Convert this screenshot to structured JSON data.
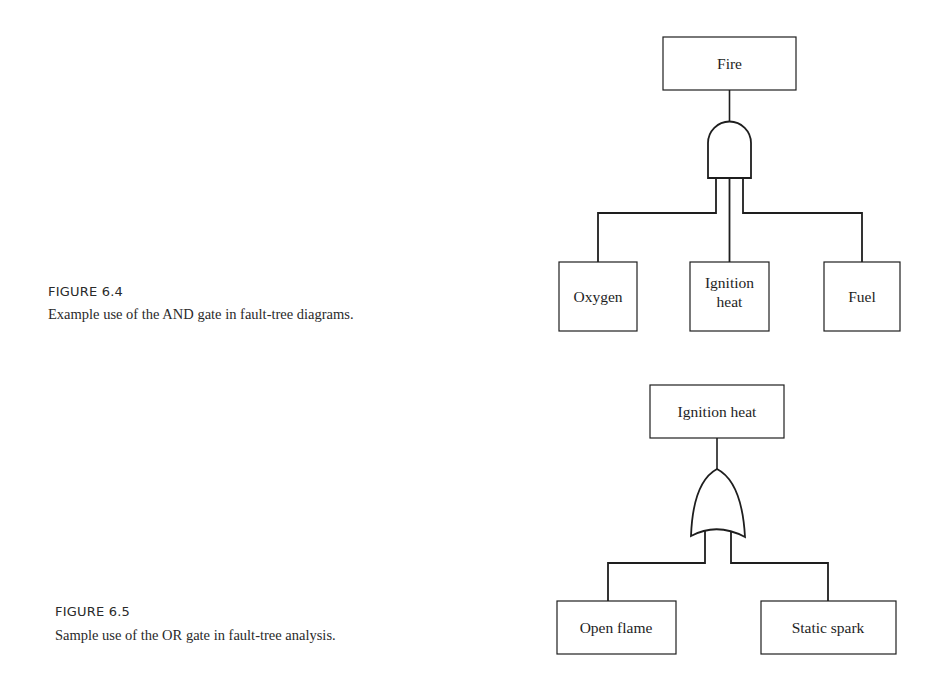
{
  "figures": [
    {
      "label": "FIGURE 6.4",
      "caption": "Example use of the AND gate in fault-tree diagrams.",
      "diagram": {
        "top_event": "Fire",
        "gate": "AND",
        "inputs": [
          {
            "lines": [
              "Oxygen"
            ]
          },
          {
            "lines": [
              "Ignition",
              "heat"
            ]
          },
          {
            "lines": [
              "Fuel"
            ]
          }
        ]
      }
    },
    {
      "label": "FIGURE 6.5",
      "caption": "Sample use of the OR gate in fault-tree analysis.",
      "diagram": {
        "top_event": "Ignition heat",
        "gate": "OR",
        "inputs": [
          {
            "lines": [
              "Open flame"
            ]
          },
          {
            "lines": [
              "Static spark"
            ]
          }
        ]
      }
    }
  ],
  "colors": {
    "ink": "#1e1e1e",
    "background": "#ffffff"
  }
}
